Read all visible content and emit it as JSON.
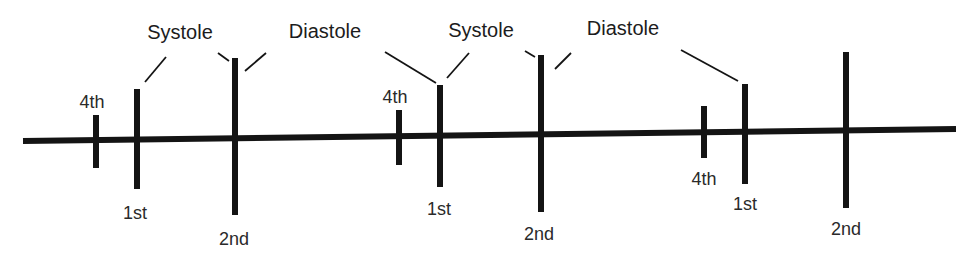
{
  "diagram": {
    "colors": {
      "ink": "#141414",
      "text": "#1c1c1c",
      "background": "#ffffff"
    },
    "baseline": {
      "x1": 23,
      "y1": 141,
      "x2": 956,
      "y2": 129,
      "stroke_width": 6
    },
    "ticks": [
      {
        "id": "cycle1-4th",
        "sound": "4th",
        "x": 96,
        "y_top": 115,
        "y_bottom": 168,
        "width": 6
      },
      {
        "id": "cycle1-1st",
        "sound": "1st",
        "x": 137,
        "y_top": 89,
        "y_bottom": 189,
        "width": 6
      },
      {
        "id": "cycle1-2nd",
        "sound": "2nd",
        "x": 235,
        "y_top": 58,
        "y_bottom": 215,
        "width": 6
      },
      {
        "id": "cycle2-4th",
        "sound": "4th",
        "x": 399,
        "y_top": 110,
        "y_bottom": 165,
        "width": 6
      },
      {
        "id": "cycle2-1st",
        "sound": "1st",
        "x": 440,
        "y_top": 85,
        "y_bottom": 187,
        "width": 6
      },
      {
        "id": "cycle2-2nd",
        "sound": "2nd",
        "x": 541,
        "y_top": 55,
        "y_bottom": 212,
        "width": 6
      },
      {
        "id": "cycle3-4th",
        "sound": "4th",
        "x": 704,
        "y_top": 106,
        "y_bottom": 158,
        "width": 6
      },
      {
        "id": "cycle3-1st",
        "sound": "1st",
        "x": 745,
        "y_top": 84,
        "y_bottom": 184,
        "width": 6
      },
      {
        "id": "cycle3-2nd",
        "sound": "2nd",
        "x": 846,
        "y_top": 52,
        "y_bottom": 208,
        "width": 6
      }
    ],
    "sound_labels": [
      {
        "text": "4th",
        "x": 92,
        "y": 108
      },
      {
        "text": "1st",
        "x": 135,
        "y": 219
      },
      {
        "text": "2nd",
        "x": 234,
        "y": 245
      },
      {
        "text": "4th",
        "x": 395,
        "y": 103
      },
      {
        "text": "1st",
        "x": 439,
        "y": 215
      },
      {
        "text": "2nd",
        "x": 539,
        "y": 240
      },
      {
        "text": "4th",
        "x": 704,
        "y": 185
      },
      {
        "text": "1st",
        "x": 745,
        "y": 210
      },
      {
        "text": "2nd",
        "x": 846,
        "y": 235
      }
    ],
    "phase_labels": [
      {
        "text": "Systole",
        "x": 180,
        "y": 39
      },
      {
        "text": "Diastole",
        "x": 325,
        "y": 38
      },
      {
        "text": "Systole",
        "x": 481,
        "y": 37
      },
      {
        "text": "Diastole",
        "x": 623,
        "y": 35
      }
    ],
    "leader_lines": [
      {
        "id": "systole1-to-1st",
        "x1": 166,
        "y1": 57,
        "x2": 145,
        "y2": 82
      },
      {
        "id": "systole1-to-2nd",
        "x1": 218,
        "y1": 53,
        "x2": 229,
        "y2": 61
      },
      {
        "id": "diastole1-from-2nd",
        "x1": 245,
        "y1": 71,
        "x2": 266,
        "y2": 53
      },
      {
        "id": "diastole1-to-1st",
        "x1": 385,
        "y1": 52,
        "x2": 436,
        "y2": 83
      },
      {
        "id": "systole2-to-1st",
        "x1": 469,
        "y1": 53,
        "x2": 447,
        "y2": 78
      },
      {
        "id": "systole2-to-2nd",
        "x1": 525,
        "y1": 51,
        "x2": 535,
        "y2": 57
      },
      {
        "id": "diastole2-from-2nd",
        "x1": 555,
        "y1": 69,
        "x2": 571,
        "y2": 53
      },
      {
        "id": "diastole2-to-1st",
        "x1": 681,
        "y1": 50,
        "x2": 738,
        "y2": 81
      }
    ]
  }
}
